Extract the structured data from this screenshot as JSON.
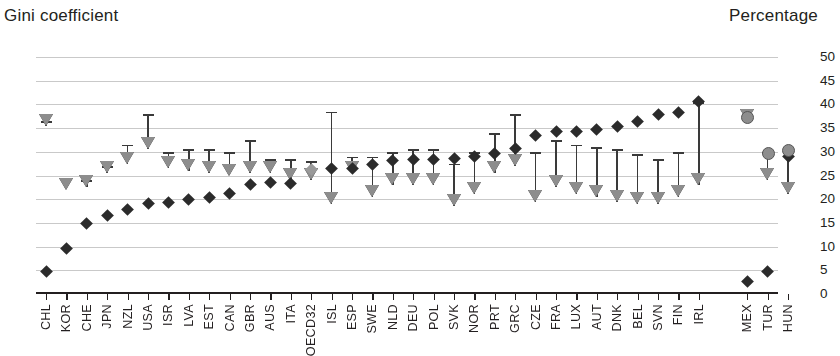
{
  "titles": {
    "left_axis": "Gini coefficient",
    "right_axis": "Percentage"
  },
  "chart_data": {
    "type": "scatter",
    "title": "",
    "xlabel": "",
    "ylabel": "Gini coefficient",
    "y2label": "Percentage",
    "ylim": [
      10,
      60
    ],
    "y2lim": [
      0,
      50
    ],
    "yticks": [
      60,
      55,
      50,
      45,
      40,
      35,
      30,
      25,
      20,
      15,
      10
    ],
    "y2ticks": [
      50,
      45,
      40,
      35,
      30,
      25,
      20,
      15,
      10,
      5,
      0
    ],
    "grid": true,
    "legend_position": "none",
    "categories": [
      "CHL",
      "KOR",
      "CHE",
      "JPN",
      "NZL",
      "USA",
      "ISR",
      "LVA",
      "EST",
      "CAN",
      "GBR",
      "AUS",
      "ITA",
      "OECD32",
      "ISL",
      "ESP",
      "SWE",
      "NLD",
      "DEU",
      "POL",
      "SVK",
      "NOR",
      "PRT",
      "GRC",
      "CZE",
      "FRA",
      "LUX",
      "AUT",
      "DNK",
      "BEL",
      "SVN",
      "FIN",
      "IRL",
      "MEX",
      "TUR",
      "HUN"
    ],
    "gap_after_category": "IRL",
    "series": [
      {
        "name": "Gini coefficient",
        "marker": "diamond",
        "axis": "left",
        "color": "#2b2b2b",
        "values": [
          14.8,
          19.7,
          24.8,
          26.5,
          27.8,
          29.0,
          29.3,
          30.0,
          30.3,
          31.2,
          33.0,
          33.5,
          33.3,
          36.3,
          36.5,
          36.5,
          37.3,
          38.2,
          38.3,
          38.4,
          38.6,
          39.0,
          39.6,
          40.7,
          43.4,
          44.2,
          44.3,
          44.6,
          45.4,
          46.4,
          47.8,
          48.3,
          50.7,
          12.7,
          14.7,
          39.0
        ]
      },
      {
        "name": "Percentage upper",
        "marker": "cap",
        "axis": "right",
        "color": "#3a3a3a",
        "values": [
          36.5,
          22.0,
          24.0,
          27.0,
          31.5,
          38.0,
          30.0,
          30.5,
          30.5,
          30.0,
          32.5,
          28.5,
          28.5,
          28.0,
          38.5,
          29.0,
          29.0,
          30.0,
          30.5,
          30.5,
          27.5,
          30.0,
          34.0,
          38.0,
          30.0,
          32.5,
          31.5,
          31.0,
          30.5,
          29.5,
          28.5,
          30.0,
          40.5,
          37.5,
          30.0,
          30.5
        ]
      },
      {
        "name": "Percentage",
        "marker": "triangle-down",
        "axis": "right",
        "color": "#8d8d8d",
        "values": [
          35.5,
          22.0,
          22.5,
          25.5,
          27.5,
          30.5,
          26.5,
          26.0,
          25.5,
          25.0,
          25.5,
          25.5,
          24.0,
          24.0,
          19.0,
          25.5,
          20.5,
          23.0,
          23.0,
          23.0,
          18.5,
          21.0,
          25.5,
          27.0,
          19.5,
          22.5,
          21.0,
          20.5,
          19.5,
          19.0,
          19.0,
          20.5,
          23.0,
          36.5,
          24.0,
          21.0
        ]
      }
    ]
  }
}
